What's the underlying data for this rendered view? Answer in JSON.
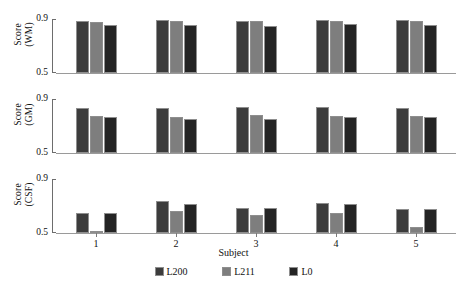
{
  "chart_data": {
    "type": "bar",
    "title": "",
    "subtitle": "",
    "xlabel": "Subject",
    "categories": [
      "1",
      "2",
      "3",
      "4",
      "5"
    ],
    "ylim": [
      0.5,
      0.9
    ],
    "yticks": [
      "0.5",
      "0.9"
    ],
    "grid": false,
    "legend_position": "bottom",
    "legend_entries": [
      "L200",
      "L211",
      "L0"
    ],
    "colors": {
      "L200": "#3c3c3c",
      "L211": "#7e7e7e",
      "L0": "#242424",
      "axis": "#6d6d6d",
      "baseline": "#9a9a9a",
      "text": "#111111",
      "background": "#ffffff"
    },
    "panels": [
      {
        "id": "wm",
        "ylabel_line1": "Score",
        "ylabel_line2": "(WM)",
        "ylabel": "Score (WM)",
        "ytick_top": "0.9",
        "ytick_bottom": "0.5",
        "series": [
          {
            "name": "L200",
            "values": [
              0.885,
              0.89,
              0.885,
              0.89,
              0.89
            ]
          },
          {
            "name": "L211",
            "values": [
              0.88,
              0.886,
              0.886,
              0.884,
              0.886
            ]
          },
          {
            "name": "L0",
            "values": [
              0.855,
              0.855,
              0.845,
              0.86,
              0.855
            ]
          }
        ]
      },
      {
        "id": "gm",
        "ylabel_line1": "Score",
        "ylabel_line2": "(GM)",
        "ylabel": "Score (GM)",
        "ytick_top": "0.9",
        "ytick_bottom": "0.5",
        "series": [
          {
            "name": "L200",
            "values": [
              0.835,
              0.835,
              0.84,
              0.84,
              0.835
            ]
          },
          {
            "name": "L211",
            "values": [
              0.775,
              0.77,
              0.785,
              0.775,
              0.775
            ]
          },
          {
            "name": "L0",
            "values": [
              0.765,
              0.755,
              0.755,
              0.77,
              0.765
            ]
          }
        ]
      },
      {
        "id": "csf",
        "ylabel_line1": "Score",
        "ylabel_line2": "(CSF)",
        "ylabel": "Score (CSF)",
        "ytick_top": "0.9",
        "ytick_bottom": "0.5",
        "series": [
          {
            "name": "L200",
            "values": [
              0.645,
              0.735,
              0.685,
              0.725,
              0.68
            ]
          },
          {
            "name": "L211",
            "values": [
              0.503,
              0.66,
              0.635,
              0.645,
              0.545
            ]
          },
          {
            "name": "L0",
            "values": [
              0.645,
              0.715,
              0.685,
              0.715,
              0.68
            ]
          }
        ]
      }
    ]
  }
}
